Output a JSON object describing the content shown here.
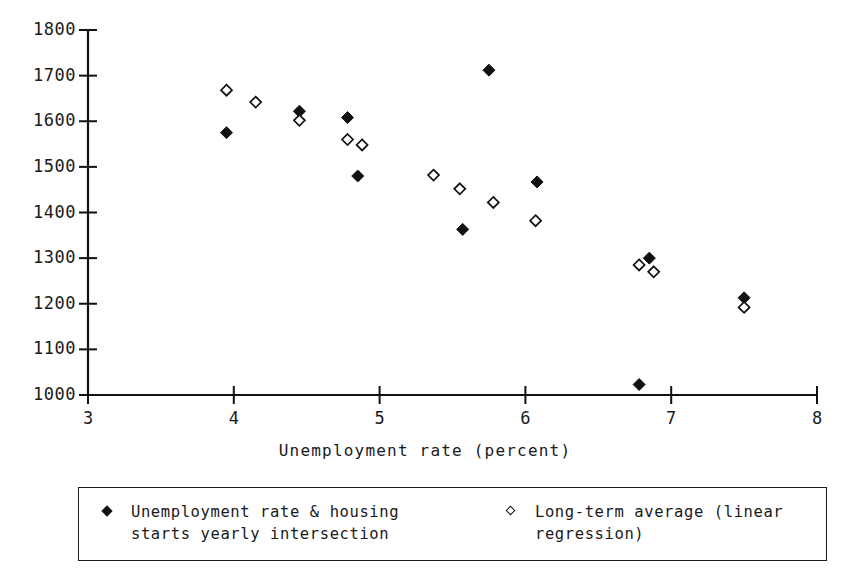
{
  "chart_data": {
    "type": "scatter",
    "title": "",
    "xlabel": "Unemployment rate (percent)",
    "ylabel": "",
    "xlim": [
      3,
      8
    ],
    "ylim": [
      1000,
      1800
    ],
    "xticks": [
      3,
      4,
      5,
      6,
      7,
      8
    ],
    "yticks": [
      1000,
      1100,
      1200,
      1300,
      1400,
      1500,
      1600,
      1700,
      1800
    ],
    "grid": false,
    "legend_position": "below-axes",
    "series": [
      {
        "name": "Unemployment rate & housing\nstarts yearly intersection",
        "marker": "filled-diamond",
        "color": "#111111",
        "points": [
          [
            3.95,
            1575
          ],
          [
            4.45,
            1622
          ],
          [
            4.78,
            1608
          ],
          [
            4.85,
            1480
          ],
          [
            5.57,
            1363
          ],
          [
            5.75,
            1712
          ],
          [
            6.08,
            1467
          ],
          [
            6.78,
            1023
          ],
          [
            6.85,
            1300
          ],
          [
            7.5,
            1213
          ]
        ]
      },
      {
        "name": "Long-term average (linear\nregression)",
        "marker": "open-diamond",
        "color": "#111111",
        "points": [
          [
            3.95,
            1668
          ],
          [
            4.15,
            1642
          ],
          [
            4.45,
            1602
          ],
          [
            4.78,
            1560
          ],
          [
            4.88,
            1548
          ],
          [
            5.37,
            1482
          ],
          [
            5.55,
            1452
          ],
          [
            5.78,
            1422
          ],
          [
            6.07,
            1382
          ],
          [
            6.78,
            1285
          ],
          [
            6.88,
            1270
          ],
          [
            7.5,
            1192
          ]
        ]
      }
    ]
  },
  "axes": {
    "y_tick_labels": [
      "1800",
      "1700",
      "1600",
      "1500",
      "1400",
      "1300",
      "1200",
      "1100",
      "1000"
    ],
    "x_tick_labels": [
      "3",
      "4",
      "5",
      "6",
      "7",
      "8"
    ],
    "x_axis_title": "Unemployment rate (percent)"
  },
  "legend": {
    "entries": [
      {
        "marker": "filled-diamond-icon",
        "label": "Unemployment rate & housing\nstarts yearly intersection"
      },
      {
        "marker": "open-diamond-icon",
        "label": "Long-term average (linear\nregression)"
      }
    ]
  },
  "colors": {
    "ink": "#111111",
    "background": "#ffffff"
  }
}
